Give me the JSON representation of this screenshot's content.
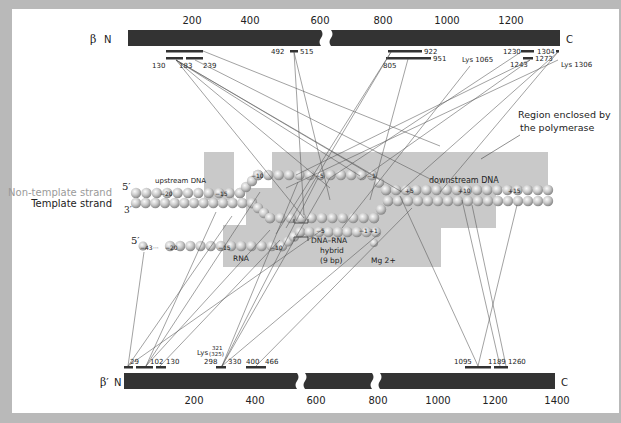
{
  "beta": {
    "label_greek": "β",
    "label_n": "N",
    "label_c": "C",
    "ticks": [
      {
        "value": "200",
        "x": 192
      },
      {
        "value": "400",
        "x": 250
      },
      {
        "value": "600",
        "x": 320
      },
      {
        "value": "800",
        "x": 383
      },
      {
        "value": "1000",
        "x": 447
      },
      {
        "value": "1200",
        "x": 511
      }
    ],
    "segments": [
      {
        "label_start": "130",
        "label_mid": "183",
        "label_end": "239"
      },
      {
        "label_start": "492",
        "label_end": "515"
      },
      {
        "label_start": "805",
        "label_mid": "922",
        "label_end": "951"
      },
      {
        "label": "Lys 1065"
      },
      {
        "label_start": "1230",
        "label_end": "1304"
      },
      {
        "label_start": "1243",
        "label_end": "1273"
      },
      {
        "label": "Lys 1306"
      }
    ]
  },
  "beta_prime": {
    "label_greek": "β′",
    "label_n": "N",
    "label_c": "C",
    "ticks": [
      {
        "value": "200",
        "x": 194
      },
      {
        "value": "400",
        "x": 255
      },
      {
        "value": "600",
        "x": 316
      },
      {
        "value": "800",
        "x": 378
      },
      {
        "value": "1000",
        "x": 438
      },
      {
        "value": "1200",
        "x": 495
      },
      {
        "value": "1400",
        "x": 557
      }
    ],
    "segments": [
      {
        "label": "29"
      },
      {
        "label_start": "102",
        "label_end": "130"
      },
      {
        "label_start": "298",
        "label_end": "330",
        "lys": "Lys",
        "lys_top": "321",
        "lys_bottom": "(325)"
      },
      {
        "label_start": "400",
        "label_end": "466"
      },
      {
        "label_start": "1095",
        "label_mid": "1189",
        "label_end": "1260"
      }
    ]
  },
  "dna": {
    "non_template_label": "Non-template strand",
    "template_label": "Template strand",
    "five_prime": "5′",
    "three_prime": "3′",
    "rna_five_prime": "5′",
    "upstream_label": "upstream DNA",
    "downstream_label": "downstream DNA",
    "rna_label": "RNA",
    "hybrid_label_1": "DNA–RNA",
    "hybrid_label_2": "hybrid",
    "hybrid_label_3": "(9 bp)",
    "mg_label": "Mg 2+",
    "positions": {
      "up_m20": "−20",
      "up_m15": "−15",
      "nt_m10": "−10",
      "nt_m5": "−5",
      "nt_m1": "−1",
      "dn_p5": "+5",
      "dn_p10": "+10",
      "dn_p15": "+15",
      "rna_m43": "−43",
      "rna_dots": "···",
      "rna_m20": "−20",
      "rna_m15": "−15",
      "rna_m10": "−10",
      "hy_m5": "−5",
      "hy_m1": "−1",
      "hy_p1": "+1"
    }
  },
  "annotation": {
    "region_line1": "Region enclosed by",
    "region_line2": "the polymerase"
  },
  "colors": {
    "bar": "#333333",
    "polymerase_region": "#c8c8c8",
    "background": "#b9b9b9",
    "panel": "#ffffff",
    "bead": "#c4c4c4",
    "line": "#444444"
  }
}
